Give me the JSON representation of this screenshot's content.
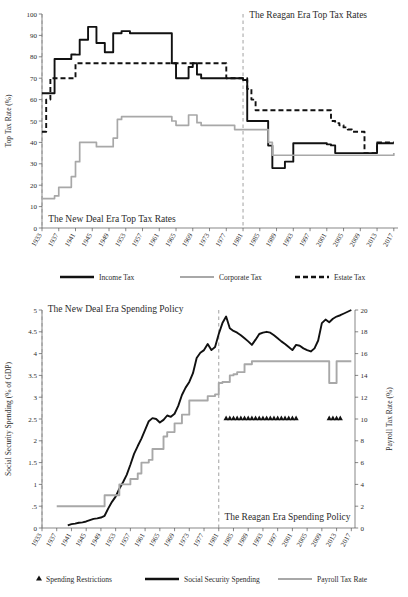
{
  "chart_data": [
    {
      "type": "line",
      "id": "top-tax-rates",
      "title": "",
      "xlabel": "",
      "ylabel": "Top Tax Rate (%)",
      "xlim": [
        1933,
        2018
      ],
      "ylim": [
        0,
        100
      ],
      "grid": false,
      "legend_position": "bottom",
      "xticks": [
        1933,
        1937,
        1941,
        1945,
        1949,
        1953,
        1957,
        1961,
        1965,
        1969,
        1973,
        1977,
        1981,
        1985,
        1989,
        1993,
        1997,
        2001,
        2005,
        2009,
        2013,
        2017
      ],
      "yticks": [
        0,
        10,
        20,
        30,
        40,
        50,
        60,
        70,
        80,
        90,
        100
      ],
      "annotations": [
        {
          "text": "The New Deal Era Top Tax Rates",
          "x": 1934,
          "y": 3
        },
        {
          "text": "The Reagan Era Top Tax Rates",
          "x": 1982,
          "y": 98
        }
      ],
      "vertical_markers": [
        1933,
        1981
      ],
      "series": [
        {
          "name": "Income Tax",
          "style": "solid",
          "color": "#111111",
          "x": [
            1933,
            1934,
            1935,
            1936,
            1937,
            1938,
            1939,
            1940,
            1941,
            1942,
            1943,
            1944,
            1945,
            1946,
            1947,
            1948,
            1949,
            1950,
            1951,
            1952,
            1953,
            1954,
            1955,
            1963,
            1964,
            1965,
            1966,
            1967,
            1968,
            1969,
            1970,
            1971,
            1972,
            1976,
            1977,
            1978,
            1979,
            1980,
            1981,
            1982,
            1983,
            1986,
            1987,
            1988,
            1989,
            1990,
            1991,
            1992,
            1993,
            2000,
            2001,
            2002,
            2003,
            2012,
            2013,
            2017
          ],
          "values": [
            63,
            63,
            63,
            79,
            79,
            79,
            79,
            81.1,
            81,
            88,
            88,
            94,
            94,
            86.45,
            86.45,
            82.13,
            82.13,
            91,
            91,
            92,
            92,
            91,
            91,
            91,
            77,
            70,
            70,
            70,
            75.25,
            77,
            71.75,
            70,
            70,
            70,
            70,
            70,
            70,
            70,
            69.125,
            50,
            50,
            50,
            38.5,
            28,
            28,
            28,
            31,
            31,
            39.6,
            39.6,
            39.1,
            38.6,
            35,
            35,
            39.6,
            39.6
          ]
        },
        {
          "name": "Corporate Tax",
          "style": "solid",
          "color": "#a8a8a8",
          "x": [
            1933,
            1936,
            1937,
            1938,
            1939,
            1940,
            1941,
            1942,
            1945,
            1946,
            1949,
            1950,
            1951,
            1952,
            1964,
            1965,
            1968,
            1969,
            1970,
            1971,
            1979,
            1980,
            1986,
            1987,
            1988,
            2017
          ],
          "values": [
            13.75,
            15,
            19,
            19,
            19,
            24,
            31,
            40,
            40,
            38,
            38,
            42,
            50.75,
            52,
            50,
            48,
            52.8,
            52.8,
            49.2,
            48,
            46,
            46,
            46,
            40,
            34,
            35
          ]
        },
        {
          "name": "Estate Tax",
          "style": "dashed",
          "color": "#111111",
          "x": [
            1933,
            1934,
            1935,
            1940,
            1941,
            1954,
            1976,
            1977,
            1981,
            1982,
            1983,
            1984,
            1985,
            2001,
            2002,
            2003,
            2004,
            2005,
            2006,
            2007,
            2009,
            2010,
            2011,
            2012,
            2013,
            2017
          ],
          "values": [
            45,
            60,
            70,
            70,
            77,
            77,
            77,
            70,
            70,
            65,
            60,
            55,
            55,
            55,
            50,
            49,
            48,
            47,
            46,
            45,
            45,
            35,
            35,
            35,
            40,
            40
          ]
        }
      ],
      "legend": [
        "Income Tax",
        "Corporate Tax",
        "Estate Tax"
      ]
    },
    {
      "type": "line",
      "id": "spending-policy",
      "title": "",
      "xlabel": "",
      "ylabel": "Social Security Spending (% of GDP)",
      "ylabel_right": "Payroll Tax Rate (%)",
      "xlim": [
        1933,
        2018
      ],
      "ylim": [
        0,
        5
      ],
      "ylim_right": [
        0,
        20
      ],
      "grid": false,
      "legend_position": "bottom",
      "xticks": [
        1933,
        1937,
        1941,
        1945,
        1949,
        1953,
        1957,
        1961,
        1965,
        1969,
        1973,
        1977,
        1981,
        1985,
        1989,
        1993,
        1997,
        2001,
        2005,
        2009,
        2013,
        2017
      ],
      "yticks": [
        "0",
        ".5",
        "1",
        "1.5",
        "2",
        "2.5",
        "3",
        "3.5",
        "4",
        "4.5",
        "5"
      ],
      "yticks_right": [
        0,
        2,
        4,
        6,
        8,
        10,
        12,
        14,
        16,
        18,
        20
      ],
      "annotations": [
        {
          "text": "The New Deal Era Spending Policy",
          "x": 1934,
          "y": 4.95
        },
        {
          "text": "The Reagan Era Spending Policy",
          "x": 1982,
          "y": 0.18
        }
      ],
      "vertical_markers": [
        1933,
        1981
      ],
      "series": [
        {
          "name": "Social Security Spending",
          "style": "solid",
          "color": "#111111",
          "axis": "left",
          "x": [
            1940,
            1941,
            1942,
            1943,
            1944,
            1945,
            1946,
            1947,
            1948,
            1949,
            1950,
            1951,
            1952,
            1953,
            1954,
            1955,
            1956,
            1957,
            1958,
            1959,
            1960,
            1961,
            1962,
            1963,
            1964,
            1965,
            1966,
            1967,
            1968,
            1969,
            1970,
            1971,
            1972,
            1973,
            1974,
            1975,
            1976,
            1977,
            1978,
            1979,
            1980,
            1981,
            1982,
            1983,
            1984,
            1985,
            1986,
            1987,
            1988,
            1989,
            1990,
            1991,
            1992,
            1993,
            1994,
            1995,
            1996,
            1997,
            1998,
            1999,
            2000,
            2001,
            2002,
            2003,
            2004,
            2005,
            2006,
            2007,
            2008,
            2009,
            2010,
            2011,
            2012,
            2013,
            2014,
            2015,
            2016,
            2017
          ],
          "values": [
            0.06,
            0.09,
            0.1,
            0.12,
            0.13,
            0.15,
            0.18,
            0.21,
            0.22,
            0.24,
            0.28,
            0.45,
            0.6,
            0.72,
            0.9,
            1.05,
            1.22,
            1.45,
            1.7,
            1.88,
            2.05,
            2.25,
            2.45,
            2.52,
            2.5,
            2.42,
            2.48,
            2.58,
            2.55,
            2.62,
            2.8,
            3.05,
            3.22,
            3.35,
            3.55,
            3.9,
            4.02,
            4.08,
            4.22,
            4.08,
            4.15,
            4.45,
            4.7,
            4.85,
            4.58,
            4.52,
            4.48,
            4.42,
            4.35,
            4.28,
            4.2,
            4.32,
            4.45,
            4.48,
            4.5,
            4.48,
            4.42,
            4.35,
            4.28,
            4.22,
            4.15,
            4.08,
            4.2,
            4.18,
            4.12,
            4.08,
            4.05,
            4.12,
            4.3,
            4.7,
            4.78,
            4.72,
            4.8,
            4.85,
            4.88,
            4.92,
            4.96,
            5.0
          ]
        },
        {
          "name": "Payroll Tax Rate",
          "style": "solid",
          "color": "#a8a8a8",
          "axis": "right",
          "x": [
            1937,
            1949,
            1950,
            1953,
            1954,
            1956,
            1957,
            1958,
            1959,
            1960,
            1961,
            1962,
            1963,
            1965,
            1966,
            1967,
            1968,
            1969,
            1970,
            1971,
            1972,
            1973,
            1974,
            1977,
            1978,
            1979,
            1980,
            1981,
            1982,
            1984,
            1985,
            1986,
            1987,
            1988,
            1990,
            2010,
            2011,
            2012,
            2013,
            2017
          ],
          "values": [
            2,
            2,
            3,
            3,
            4,
            4,
            4.5,
            4.5,
            5,
            6,
            6,
            6.25,
            7.25,
            7.25,
            8.4,
            8.8,
            8.8,
            9.6,
            9.6,
            10.4,
            10.4,
            11.7,
            11.7,
            11.7,
            12.1,
            12.1,
            12.26,
            13.3,
            13.4,
            14,
            14.1,
            14.3,
            14.3,
            15.02,
            15.3,
            15.3,
            13.3,
            13.3,
            15.3,
            15.3
          ]
        },
        {
          "name": "Spending Restrictions",
          "style": "triangle-markers",
          "color": "#111111",
          "axis": "right",
          "x": [
            1983,
            1984,
            1985,
            1986,
            1987,
            1988,
            1989,
            1990,
            1991,
            1992,
            1993,
            1994,
            1995,
            1996,
            1997,
            1998,
            1999,
            2000,
            2001,
            2002,
            2011,
            2012,
            2013,
            2014
          ],
          "values": [
            10,
            10,
            10,
            10,
            10,
            10,
            10,
            10,
            10,
            10,
            10,
            10,
            10,
            10,
            10,
            10,
            10,
            10,
            10,
            10,
            10,
            10,
            10,
            10
          ]
        }
      ],
      "legend": [
        "Spending Restrictions",
        "Social Security Spending",
        "Payroll Tax Rate"
      ]
    }
  ]
}
